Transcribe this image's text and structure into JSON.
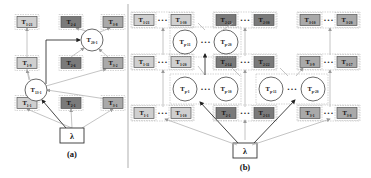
{
  "figure": {
    "panels": [
      {
        "id": "a",
        "caption": "(a)",
        "input_node": "λ",
        "circles": [
          {
            "id": "c13",
            "label": "T",
            "sub": "13-1",
            "x": 36,
            "y": 90,
            "r": 11
          },
          {
            "id": "c20",
            "label": "T",
            "sub": "20-1",
            "x": 92,
            "y": 40,
            "r": 11
          }
        ],
        "boxes": [
          {
            "label": "T",
            "sub": "1-21",
            "x": 27,
            "y": 22,
            "shade": "light"
          },
          {
            "label": "T",
            "sub": "2-4",
            "x": 71,
            "y": 22,
            "shade": "dark"
          },
          {
            "label": "T",
            "sub": "3-8",
            "x": 113,
            "y": 22,
            "shade": "mid"
          },
          {
            "label": "T",
            "sub": "1-9",
            "x": 27,
            "y": 63,
            "shade": "light"
          },
          {
            "label": "T",
            "sub": "2-6",
            "x": 71,
            "y": 63,
            "shade": "dark"
          },
          {
            "label": "T",
            "sub": "3-2",
            "x": 113,
            "y": 63,
            "shade": "mid"
          },
          {
            "label": "T",
            "sub": "1-1",
            "x": 27,
            "y": 103,
            "shade": "light"
          },
          {
            "label": "T",
            "sub": "2-1",
            "x": 71,
            "y": 103,
            "shade": "dark"
          },
          {
            "label": "T",
            "sub": "3-1",
            "x": 113,
            "y": 103,
            "shade": "mid"
          }
        ]
      },
      {
        "id": "b",
        "caption": "(b)",
        "input_node": "λ",
        "ellipsis": "• • •",
        "box_rows": [
          {
            "y": 20,
            "groups": [
              {
                "left": {
                  "sub": "1-21"
                },
                "right": {
                  "sub": "1-30"
                },
                "shade": "light"
              },
              {
                "left": {
                  "sub": "2-21"
                },
                "right": {
                  "sub": "2-30"
                },
                "shade": "dark"
              },
              {
                "left": {
                  "sub": "3-10"
                },
                "right": {
                  "sub": "3-20"
                },
                "shade": "mid"
              }
            ]
          },
          {
            "y": 62,
            "groups": [
              {
                "left": {
                  "sub": "1-11"
                },
                "right": {
                  "sub": "1-20"
                },
                "shade": "light"
              },
              {
                "left": {
                  "sub": "2-14"
                },
                "right": {
                  "sub": "2-22"
                },
                "shade": "dark"
              },
              {
                "left": {
                  "sub": "3-9"
                },
                "right": {
                  "sub": "3-17"
                },
                "shade": "mid"
              }
            ]
          },
          {
            "y": 113,
            "groups": [
              {
                "left": {
                  "sub": "1-1"
                },
                "right": {
                  "sub": "1-10"
                },
                "shade": "light"
              },
              {
                "left": {
                  "sub": "2-1"
                },
                "right": {
                  "sub": "2-13"
                },
                "shade": "dark"
              },
              {
                "left": {
                  "sub": "3-1"
                },
                "right": {
                  "sub": "3-8"
                },
                "shade": "mid"
              }
            ]
          }
        ],
        "circle_groups": [
          {
            "y": 42,
            "x1": 185,
            "x2": 226,
            "left": {
              "sub": "p-11"
            },
            "right": {
              "sub": "p-20"
            }
          },
          {
            "y": 89,
            "x1": 185,
            "x2": 226,
            "left": {
              "sub": "p-1"
            },
            "right": {
              "sub": "p-10"
            }
          },
          {
            "y": 89,
            "x1": 271,
            "x2": 313,
            "left": {
              "sub": "p-11"
            },
            "right": {
              "sub": "p-20"
            }
          }
        ]
      }
    ],
    "colors": {
      "light": "#cfcfcf",
      "mid": "#a9a9a9",
      "dark": "#7a7a7a",
      "border": "#555555",
      "edge": "#aaaaaa",
      "edge_dark": "#333333",
      "dash": "#bbbbbb"
    }
  }
}
